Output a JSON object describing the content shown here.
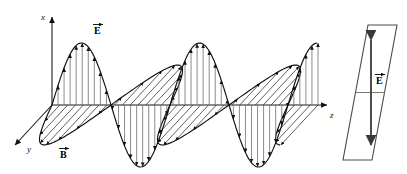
{
  "figure": {
    "background_color": "#ffffff",
    "stroke_color": "#111111",
    "e_field_color": "#6f6f6f",
    "b_field_color": "#2b2b2b",
    "plane_color": "#4a4a4a"
  },
  "axes": {
    "x": {
      "label": "x",
      "direction": "up",
      "origin_px": [
        52,
        105
      ],
      "tip_px": [
        52,
        14
      ]
    },
    "y": {
      "label": "y",
      "direction": "down-left",
      "origin_px": [
        52,
        105
      ],
      "tip_px": [
        12,
        148
      ]
    },
    "z": {
      "label": "z",
      "direction": "right",
      "origin_px": [
        52,
        105
      ],
      "tip_px": [
        330,
        105
      ]
    }
  },
  "vectors": [
    {
      "name": "E-vector-label-wave",
      "label": "E",
      "arrow": "→",
      "position_px": [
        98,
        28
      ]
    },
    {
      "name": "B-vector-label-wave",
      "label": "B",
      "arrow": "→",
      "position_px": [
        64,
        152
      ]
    },
    {
      "name": "E-vector-label-plane",
      "label": "E",
      "arrow": "→",
      "position_px": [
        378,
        78
      ]
    }
  ],
  "wave": {
    "type": "sinusoid",
    "description": "Transverse electromagnetic wave: E oscillates along x, B oscillates along y, propagation along z",
    "amplitude_px": 62,
    "wavelength_px": 118,
    "cycles": 2.2,
    "z_start_px": 52,
    "z_end_px": 318,
    "e_field": {
      "component": "x",
      "arrow_count": 44,
      "arrow_style": "double-tipped vertical stems with arrowheads at the curve",
      "color": "#6f6f6f"
    },
    "b_field": {
      "component": "y",
      "hatch_count": 34,
      "hatch_style": "slanted parallel lines toward the y axis with arrowheads on the lobe boundary",
      "color": "#2b2b2b",
      "phase": "in phase with E, rotated 90 degrees"
    }
  },
  "polarization_plane": {
    "name": "polarization-plane",
    "shape": "parallelogram",
    "corners_px": [
      [
        368,
        25
      ],
      [
        397,
        25
      ],
      [
        372,
        160
      ],
      [
        343,
        160
      ]
    ],
    "midline": true,
    "arrow": {
      "name": "e-polarization-arrow",
      "style": "double-headed vertical",
      "top_px": [
        371,
        40
      ],
      "bottom_px": [
        371,
        145
      ],
      "label": "E"
    }
  }
}
